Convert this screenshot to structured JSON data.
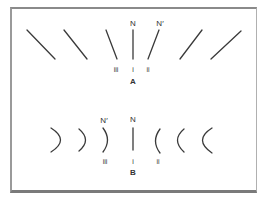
{
  "figure": {
    "panel_a": {
      "label": "A",
      "top_labels": {
        "normal": "N",
        "normal_prime": "N′"
      },
      "bottom_labels": {
        "iii": "iii",
        "i": "i",
        "ii": "ii"
      },
      "lines": [
        {
          "id": "a-line-1",
          "x1": 27,
          "y1": 30,
          "x2": 55,
          "y2": 59
        },
        {
          "id": "a-line-2",
          "x1": 64,
          "y1": 30,
          "x2": 87,
          "y2": 59
        },
        {
          "id": "a-line-iii",
          "x1": 106,
          "y1": 30,
          "x2": 117,
          "y2": 59
        },
        {
          "id": "a-line-i",
          "x1": 133,
          "y1": 30,
          "x2": 133,
          "y2": 59
        },
        {
          "id": "a-line-ii",
          "x1": 159,
          "y1": 30,
          "x2": 148,
          "y2": 59
        },
        {
          "id": "a-line-6",
          "x1": 202,
          "y1": 30,
          "x2": 180,
          "y2": 59
        },
        {
          "id": "a-line-7",
          "x1": 241,
          "y1": 31,
          "x2": 211,
          "y2": 59
        }
      ]
    },
    "panel_b": {
      "label": "B",
      "top_labels": {
        "normal": "N",
        "normal_prime": "N′"
      },
      "bottom_labels": {
        "iii": "iii",
        "i": "i",
        "ii": "ii"
      },
      "shapes": [
        {
          "id": "b-arc-1",
          "type": "arc-right",
          "d": "M51,128 Q70,140 51,152"
        },
        {
          "id": "b-arc-2",
          "type": "arc-right",
          "d": "M79,129 Q92,140 79,151"
        },
        {
          "id": "b-arc-iii",
          "type": "arc-right",
          "d": "M103,128 Q112,140 103,152"
        },
        {
          "id": "b-line-i",
          "type": "line",
          "d": "M133,128 L133,150"
        },
        {
          "id": "b-arc-ii",
          "type": "arc-left",
          "d": "M160,129 Q151,141 160,153"
        },
        {
          "id": "b-arc-6",
          "type": "arc-left",
          "d": "M184,129 Q171,140 184,152"
        },
        {
          "id": "b-arc-7",
          "type": "arc-left",
          "d": "M212,128 Q193,140 212,153"
        }
      ]
    },
    "colors": {
      "stroke": "#3a3a3a",
      "text": "#333333",
      "frame": "#8a8a8a"
    }
  }
}
